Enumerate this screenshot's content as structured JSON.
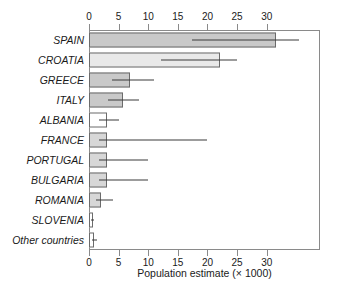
{
  "chart_data": {
    "type": "bar",
    "orientation": "horizontal",
    "title": "",
    "xlabel": "Population estimate (× 1000)",
    "ylabel": "",
    "xlim": [
      0,
      39
    ],
    "xticks": [
      0,
      5,
      10,
      15,
      20,
      25,
      30
    ],
    "xticklabels": [
      "0",
      "5",
      "10",
      "15",
      "20",
      "25",
      "30"
    ],
    "axis_positions": [
      "top",
      "bottom"
    ],
    "grid": false,
    "legend": null,
    "categories": [
      "SPAIN",
      "CROATIA",
      "GREECE",
      "ITALY",
      "ALBANIA",
      "FRANCE",
      "PORTUGAL",
      "BULGARIA",
      "ROMANIA",
      "SLOVENIA",
      "Other countries"
    ],
    "values": [
      31.5,
      22.2,
      7.0,
      5.7,
      3.0,
      3.0,
      3.0,
      3.0,
      2.0,
      0.6,
      0.9
    ],
    "error_high": [
      35.5,
      25.0,
      11.0,
      8.5,
      5.0,
      20.0,
      10.0,
      10.0,
      4.0,
      0.9,
      1.4
    ],
    "bar_colors": [
      "#c9c9c9",
      "#e9e9e9",
      "#c9c9c9",
      "#c9c9c9",
      "#ffffff",
      "#d7d7d7",
      "#d7d7d7",
      "#d7d7d7",
      "#d7d7d7",
      "#ffffff",
      "#ffffff"
    ],
    "bar_edge_color": "#6b6b6b",
    "error_color": "#3a3a3a",
    "frame_color": "#8a8a8a",
    "background": "#ffffff"
  },
  "rows": [
    {
      "label": "SPAIN",
      "value": 31.5,
      "err": 35.5,
      "color": "#c9c9c9"
    },
    {
      "label": "CROATIA",
      "value": 22.2,
      "err": 25.0,
      "color": "#e9e9e9"
    },
    {
      "label": "GREECE",
      "value": 7.0,
      "err": 11.0,
      "color": "#c9c9c9"
    },
    {
      "label": "ITALY",
      "value": 5.7,
      "err": 8.5,
      "color": "#c9c9c9"
    },
    {
      "label": "ALBANIA",
      "value": 3.0,
      "err": 5.0,
      "color": "#ffffff"
    },
    {
      "label": "FRANCE",
      "value": 3.0,
      "err": 20.0,
      "color": "#d7d7d7"
    },
    {
      "label": "PORTUGAL",
      "value": 3.0,
      "err": 10.0,
      "color": "#d7d7d7"
    },
    {
      "label": "BULGARIA",
      "value": 3.0,
      "err": 10.0,
      "color": "#d7d7d7"
    },
    {
      "label": "ROMANIA",
      "value": 2.0,
      "err": 4.0,
      "color": "#d7d7d7"
    },
    {
      "label": "SLOVENIA",
      "value": 0.6,
      "err": 0.9,
      "color": "#ffffff"
    },
    {
      "label": "Other countries",
      "value": 0.9,
      "err": 1.4,
      "color": "#ffffff"
    }
  ],
  "axis": {
    "ticks": [
      "0",
      "5",
      "10",
      "15",
      "20",
      "25",
      "30"
    ],
    "tick_values": [
      0,
      5,
      10,
      15,
      20,
      25,
      30
    ],
    "title": "Population estimate (× 1000)"
  }
}
